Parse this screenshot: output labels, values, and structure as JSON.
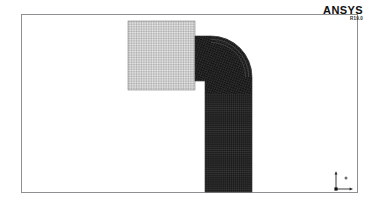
{
  "window": {
    "title": "ANSYS Mesh View",
    "background_color": "#ffffff"
  },
  "viewport": {
    "frame_color": "#8f9094",
    "background_color": "#ffffff"
  },
  "branding": {
    "name": "ANSYS",
    "version": "R19.0",
    "color": "#101010"
  },
  "axis_triad": {
    "name": "axis-triad",
    "x_label": "X",
    "y_label": "Y",
    "z_label": "Z",
    "color": "#262626"
  },
  "mesh": {
    "blocks": [
      {
        "name": "structured-grid-block",
        "description": "Uniform structured quadrilateral mesh patch",
        "shade": "light",
        "line_color": "#5a5a5a",
        "fill_color": "#e8e8e8",
        "x": 128,
        "y": 21,
        "width": 67,
        "height": 69,
        "columns": 40,
        "rows": 40
      },
      {
        "name": "elbow-pipe-mesh",
        "description": "Dense mesh on 90 degree elbow pipe with horizontal inlet and vertical outlet",
        "shade": "dark",
        "line_color": "#c8c8c8",
        "fill_color": "#141414",
        "inlet_x": 195,
        "inlet_top_y": 36,
        "bend_outer_x": 252,
        "leg_left_x": 205,
        "leg_right_x": 250,
        "outlet_y": 192,
        "boundary_layer_rings": 3
      }
    ]
  }
}
